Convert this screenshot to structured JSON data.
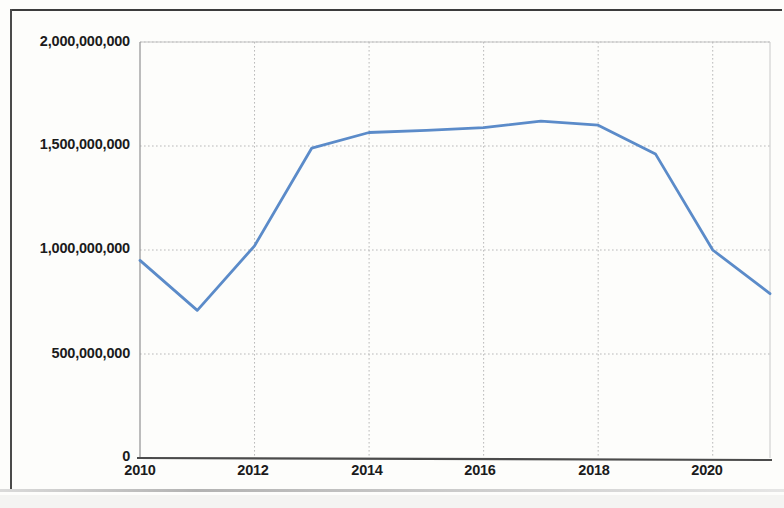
{
  "chart_data": {
    "type": "line",
    "title": "",
    "subtitle": "",
    "xlabel": "",
    "ylabel": "",
    "grid": true,
    "legend": false,
    "legend_position": "none",
    "line_color": "#5B8BC9",
    "x": [
      2010,
      2011,
      2012,
      2013,
      2014,
      2015,
      2016,
      2017,
      2018,
      2019,
      2020,
      2021
    ],
    "series": [
      {
        "name": "value",
        "values": [
          950000000,
          710000000,
          1020000000,
          1490000000,
          1565000000,
          1575000000,
          1588000000,
          1620000000,
          1600000000,
          1462000000,
          1000000000,
          790000000
        ]
      }
    ],
    "xlim": [
      2010,
      2021
    ],
    "ylim": [
      0,
      2000000000
    ],
    "x_tick_values": [
      2010,
      2012,
      2014,
      2016,
      2018,
      2020
    ],
    "x_tick_labels": [
      "2010",
      "2012",
      "2014",
      "2016",
      "2018",
      "2020"
    ],
    "y_tick_values": [
      0,
      500000000,
      1000000000,
      1500000000,
      2000000000
    ],
    "y_tick_labels": [
      "0",
      "500,000,000",
      "1,000,000,000",
      "1,500,000,000",
      "2,000,000,000"
    ]
  },
  "axes": {
    "y_axis_name": "y-axis",
    "x_axis_name": "x-axis"
  }
}
